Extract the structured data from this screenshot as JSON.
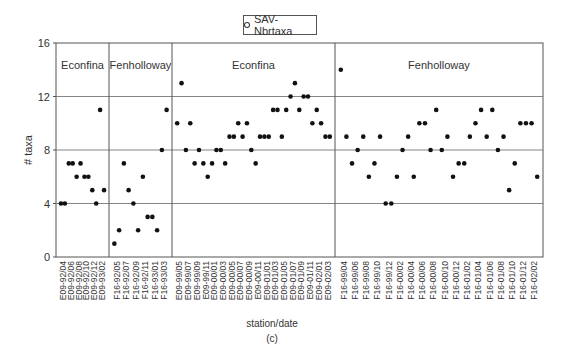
{
  "chart_data": {
    "type": "scatter",
    "title": "",
    "subtitle": "(c)",
    "xlabel": "station/date",
    "ylabel": "# taxa",
    "ylim": [
      0,
      16
    ],
    "yticks": [
      0,
      4,
      8,
      12,
      16
    ],
    "grid": {
      "horizontal": true,
      "vertical_section_dividers": true
    },
    "legend": {
      "position": "top-center",
      "entries": [
        "SAV-Nbrtaxa"
      ]
    },
    "sections": [
      {
        "label": "Econfina",
        "from_index": 0,
        "to_index": 11
      },
      {
        "label": "Fenholloway",
        "from_index": 12,
        "to_index": 23
      },
      {
        "label": "Econfina",
        "from_index": 24,
        "to_index": 61
      },
      {
        "label": "Fenholloway",
        "from_index": 62,
        "to_index": 99
      }
    ],
    "tick_labels": [
      "E09-92/04",
      "E09-92/06",
      "E09-92/08",
      "E09-92/10",
      "E09-92/12",
      "E09-93/02",
      "F16-92/05",
      "F16-92/07",
      "F16-92/09",
      "F16-92/11",
      "F16-93/01",
      "F16-93/03",
      "E09-99/05",
      "E09-99/07",
      "E09-99/09",
      "E09-99/11",
      "E09-00/01",
      "E09-00/03",
      "E09-00/05",
      "E09-00/07",
      "E09-00/09",
      "E09-00/11",
      "E09-01/01",
      "E09-01/03",
      "E09-01/05",
      "E09-01/07",
      "E09-01/09",
      "E09-01/11",
      "E09-02/01",
      "E09-02/03",
      "F16-99/04",
      "F16-99/06",
      "F16-99/08",
      "F16-99/10",
      "F16-99/12",
      "F16-00/02",
      "F16-00/04",
      "F16-00/06",
      "F16-00/08",
      "F16-00/10",
      "F16-00/12",
      "F16-01/02",
      "F16-01/04",
      "F16-01/06",
      "F16-01/08",
      "F16-01/10",
      "F16-01/12",
      "F16-02/02"
    ],
    "series": [
      {
        "name": "SAV-Nbrtaxa",
        "sections": [
          {
            "label": "Econfina",
            "values": [
              4,
              4,
              7,
              7,
              6,
              7,
              6,
              6,
              5,
              4,
              11,
              5
            ]
          },
          {
            "label": "Fenholloway",
            "values": [
              1,
              2,
              7,
              5,
              4,
              2,
              6,
              3,
              3,
              2,
              8,
              11
            ]
          },
          {
            "label": "Econfina",
            "values": [
              10,
              13,
              8,
              10,
              7,
              8,
              7,
              6,
              7,
              8,
              8,
              7,
              9,
              9,
              10,
              9,
              10,
              8,
              7,
              9,
              9,
              9,
              11,
              11,
              9,
              11,
              12,
              13,
              11,
              12,
              12,
              10,
              11,
              10,
              9,
              9
            ]
          },
          {
            "label": "Fenholloway",
            "values": [
              14,
              9,
              7,
              8,
              9,
              6,
              7,
              9,
              4,
              4,
              6,
              8,
              9,
              6,
              10,
              10,
              8,
              11,
              8,
              9,
              6,
              7,
              7,
              9,
              10,
              11,
              9,
              11,
              8,
              9,
              5,
              7,
              10,
              10,
              10,
              6
            ]
          }
        ]
      }
    ]
  },
  "legend": {
    "label": "SAV-Nbrtaxa"
  },
  "caption": "(c)"
}
